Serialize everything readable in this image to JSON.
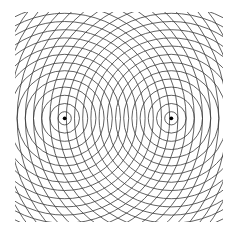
{
  "diagram": {
    "type": "two-source-interference",
    "width": 233,
    "height": 236,
    "background": "#ffffff",
    "stroke_color": "#3a3a3a",
    "stroke_width": 0.8,
    "clip": {
      "x": 15,
      "y": 12,
      "w": 208,
      "h": 210
    },
    "sources": [
      {
        "name": "left-source",
        "cx": 64.7,
        "cy": 118.3
      },
      {
        "name": "right-source",
        "cx": 171.3,
        "cy": 118.3
      }
    ],
    "first_radius": 6.6,
    "wavelength": 8.2,
    "ring_count": 22,
    "source_dot_radius": 1.9,
    "source_dot_color": "#000000"
  }
}
